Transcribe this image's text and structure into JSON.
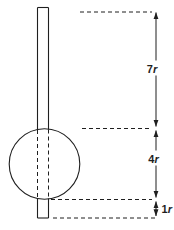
{
  "figure": {
    "type": "dimensioned-diagram",
    "colors": {
      "ink": "#1f1f1f",
      "background": "#ffffff"
    },
    "dimensions": [
      {
        "label": "7r",
        "value": "7",
        "symbol": "r"
      },
      {
        "label": "4r",
        "value": "4",
        "symbol": "r"
      },
      {
        "label": "1r",
        "value": "1",
        "symbol": "r"
      }
    ]
  }
}
